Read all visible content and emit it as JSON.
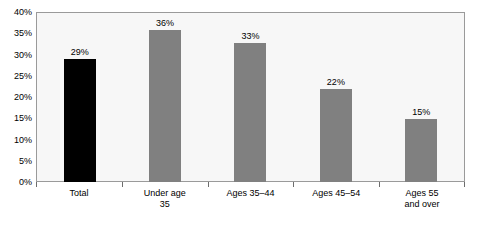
{
  "chart_data": {
    "type": "bar",
    "title": "",
    "xlabel": "",
    "ylabel": "",
    "ylim": [
      0,
      40
    ],
    "grid": false,
    "legend": "none",
    "categories": [
      "Total",
      "Under age\n35",
      "Ages 35–44",
      "Ages 45–54",
      "Ages 55\nand over"
    ],
    "values": [
      29,
      36,
      33,
      22,
      15
    ],
    "value_labels": [
      "29%",
      "36%",
      "33%",
      "22%",
      "15%"
    ],
    "bar_colors": [
      "#000000",
      "#808080",
      "#808080",
      "#808080",
      "#808080"
    ],
    "ytick_labels": [
      "0%",
      "5%",
      "10%",
      "15%",
      "20%",
      "25%",
      "30%",
      "35%",
      "40%"
    ],
    "ytick_values": [
      0,
      5,
      10,
      15,
      20,
      25,
      30,
      35,
      40
    ]
  },
  "axis": {
    "y_labels": [
      "40%",
      "35%",
      "30%",
      "25%",
      "20%",
      "15%",
      "10%",
      "5%",
      "0%"
    ],
    "x_labels": [
      {
        "line1": "Total",
        "line2": ""
      },
      {
        "line1": "Under age",
        "line2": "35"
      },
      {
        "line1": "Ages 35–44",
        "line2": ""
      },
      {
        "line1": "Ages 45–54",
        "line2": ""
      },
      {
        "line1": "Ages 55",
        "line2": "and over"
      }
    ]
  },
  "bars": [
    {
      "label": "Total",
      "value": 29,
      "value_label": "29%",
      "color": "#000000"
    },
    {
      "label": "Under age 35",
      "value": 36,
      "value_label": "36%",
      "color": "#808080"
    },
    {
      "label": "Ages 35–44",
      "value": 33,
      "value_label": "33%",
      "color": "#808080"
    },
    {
      "label": "Ages 45–54",
      "value": 22,
      "value_label": "22%",
      "color": "#808080"
    },
    {
      "label": "Ages 55 and over",
      "value": 15,
      "value_label": "15%",
      "color": "#808080"
    }
  ],
  "colors": {
    "plot_background": "#f7f7f7",
    "plot_border": "#9a9a9a",
    "highlight_bar": "#000000",
    "series_bar": "#808080",
    "text": "#000000"
  }
}
